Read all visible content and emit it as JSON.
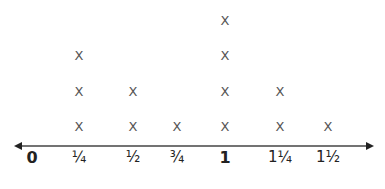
{
  "chart_data": {
    "type": "line-plot",
    "title": "",
    "xlabel": "",
    "ylabel": "",
    "marker": "X",
    "categories": [
      "0",
      "1/4",
      "1/2",
      "3/4",
      "1",
      "1 1/4",
      "1 1/2"
    ],
    "tick_labels": [
      "0",
      "¼",
      "½",
      "¾",
      "1",
      "1¼",
      "1½"
    ],
    "x": [
      0,
      0.25,
      0.5,
      0.75,
      1,
      1.25,
      1.5
    ],
    "values": [
      0,
      3,
      2,
      1,
      4,
      2,
      1
    ],
    "axis": {
      "arrows": "both",
      "grid": false
    }
  },
  "layout": {
    "tick_px": [
      32,
      79,
      133,
      177,
      225,
      280,
      328
    ],
    "row_px": [
      126,
      91,
      55,
      20
    ],
    "axis_y": 146
  }
}
